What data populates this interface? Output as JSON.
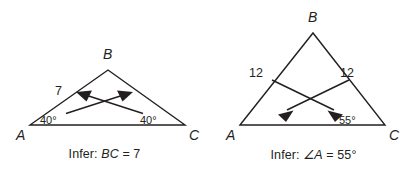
{
  "figure": {
    "background_color": "#ffffff",
    "ink_color": "#231f20"
  },
  "panels": [
    {
      "id": "left",
      "caption_prefix": "Infer:",
      "caption_subject": "BC",
      "caption_relation": " = 7",
      "caption_full": "Infer: BC = 7",
      "triangle": {
        "vertices": [
          {
            "name": "A",
            "label": "A",
            "x": 30,
            "y": 125
          },
          {
            "name": "B",
            "label": "B",
            "x": 108,
            "y": 70
          },
          {
            "name": "C",
            "label": "C",
            "x": 185,
            "y": 125
          }
        ],
        "side_labels": [
          {
            "side": "AB",
            "text": "7",
            "x": 60,
            "y": 92
          }
        ],
        "angle_labels": [
          {
            "vertex": "A",
            "text": "40°",
            "x": 47,
            "y": 121
          },
          {
            "vertex": "C",
            "text": "40°",
            "x": 147,
            "y": 121
          }
        ],
        "arrows": [
          {
            "name": "arrow-from-C-angle-to-AB-side",
            "from_x": 143,
            "from_y": 113,
            "to_x": 78,
            "to_y": 92,
            "direction": "up-left"
          },
          {
            "name": "arrow-from-A-angle-to-BC-side",
            "from_x": 66,
            "from_y": 113,
            "to_x": 131,
            "to_y": 92,
            "direction": "up-right"
          }
        ]
      }
    },
    {
      "id": "right",
      "caption_prefix": "Infer:",
      "caption_subject": "∠A",
      "caption_relation": " = 55°",
      "caption_full": "Infer: ∠A = 55°",
      "triangle": {
        "vertices": [
          {
            "name": "A",
            "label": "A",
            "x": 31,
            "y": 125
          },
          {
            "name": "B",
            "label": "B",
            "x": 104,
            "y": 33
          },
          {
            "name": "C",
            "label": "C",
            "x": 176,
            "y": 125
          }
        ],
        "side_labels": [
          {
            "side": "AB",
            "text": "12",
            "x": 48,
            "y": 73
          },
          {
            "side": "BC",
            "text": "12",
            "x": 137,
            "y": 73
          }
        ],
        "angle_labels": [
          {
            "vertex": "C",
            "text": "55°",
            "x": 136,
            "y": 121
          }
        ],
        "arrows": [
          {
            "name": "arrow-from-AB-side-to-lower-right",
            "from_x": 63,
            "from_y": 80,
            "to_x": 133,
            "to_y": 116,
            "direction": "down-right"
          },
          {
            "name": "arrow-from-BC-side-to-lower-left",
            "from_x": 140,
            "from_y": 80,
            "to_x": 70,
            "to_y": 116,
            "direction": "down-left"
          }
        ]
      }
    }
  ]
}
